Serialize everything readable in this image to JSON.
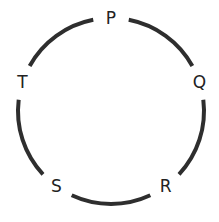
{
  "diagram": {
    "type": "circle-with-labeled-points",
    "points": [
      {
        "id": "P",
        "label": "P",
        "angle_deg": 90
      },
      {
        "id": "Q",
        "label": "Q",
        "angle_deg": 18
      },
      {
        "id": "R",
        "label": "R",
        "angle_deg": -54
      },
      {
        "id": "S",
        "label": "S",
        "angle_deg": -126
      },
      {
        "id": "T",
        "label": "T",
        "angle_deg": 162
      }
    ],
    "arc_color": "#2e2e2e"
  }
}
